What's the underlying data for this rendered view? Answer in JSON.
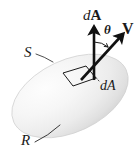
{
  "figure": {
    "canvas": {
      "width": 140,
      "height": 158,
      "background": "#ffffff"
    },
    "surface": {
      "name": "shaded-ellipsoid",
      "shape": "ellipse",
      "center_x": 70,
      "center_y": 96,
      "radius_x": 62,
      "radius_y": 36,
      "rotation_deg": -25,
      "fill_light": "#fbfbfb",
      "fill_mid": "#ededed",
      "fill_dark": "#d9d9d9",
      "edge_color": "#cfcfcf"
    },
    "patch": {
      "name": "area-element-patch",
      "outline_color": "#1a1a1a",
      "points": "63,73 86,66 96,78 73,86"
    },
    "vectors": [
      {
        "id": "normal",
        "label": "dA",
        "label_parts": {
          "italic": "d",
          "upright": "A"
        },
        "bold_symbol": true,
        "description": "outward normal area vector",
        "x1": 94,
        "y1": 79,
        "x2": 94,
        "y2": 26,
        "color": "#111111",
        "stroke_width": 2.6
      },
      {
        "id": "velocity",
        "label": "V",
        "bold_symbol": true,
        "description": "velocity vector",
        "x1": 82,
        "y1": 79,
        "x2": 124,
        "y2": 33,
        "color": "#111111",
        "stroke_width": 2.6
      }
    ],
    "angle_arc": {
      "name": "theta-arc",
      "label": "θ",
      "between": [
        "normal",
        "velocity"
      ],
      "color": "#1a1a1a"
    },
    "labels": [
      {
        "id": "dA-vector",
        "text": "dA",
        "style": "italic-d-bold-A",
        "x": 83,
        "y": 8
      },
      {
        "id": "theta",
        "text": "θ",
        "style": "bold-italic",
        "x": 104,
        "y": 23
      },
      {
        "id": "V",
        "text": "V",
        "style": "bold-upright",
        "x": 122,
        "y": 21
      },
      {
        "id": "dA-scalar",
        "text": "dA",
        "style": "italic",
        "x": 100,
        "y": 79
      },
      {
        "id": "S",
        "text": "S",
        "style": "italic",
        "x": 24,
        "y": 45
      },
      {
        "id": "R",
        "text": "R",
        "style": "italic",
        "x": 21,
        "y": 133
      }
    ],
    "leader_lines": [
      {
        "id": "leader-S",
        "from_label": "S",
        "path": "M 36 54 Q 44 56 53 62",
        "color": "#333333"
      },
      {
        "id": "leader-R",
        "path": "M 35 142 Q 47 136 60 125",
        "color": "#333333"
      },
      {
        "id": "leader-dA",
        "path": "M 91 70 L 100 82",
        "color": "#333333",
        "dashed": true
      }
    ]
  }
}
